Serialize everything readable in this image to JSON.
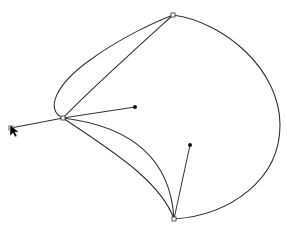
{
  "canvas": {
    "width": 287,
    "height": 232,
    "background": "#ffffff",
    "stroke_color": "#333333",
    "tool": "bezier-pen"
  },
  "anchors": [
    {
      "id": "anchor-left",
      "x": 11,
      "y": 128
    },
    {
      "id": "anchor-junction",
      "x": 63,
      "y": 118
    },
    {
      "id": "anchor-top",
      "x": 173,
      "y": 15
    },
    {
      "id": "anchor-bottom",
      "x": 174,
      "y": 219
    }
  ],
  "handles": [
    {
      "id": "handle-right",
      "x": 135,
      "y": 107,
      "from": "anchor-junction"
    },
    {
      "id": "handle-lower",
      "x": 190,
      "y": 145,
      "from": "anchor-bottom"
    }
  ],
  "cursor": {
    "type": "arrow",
    "x": 10,
    "y": 125
  }
}
